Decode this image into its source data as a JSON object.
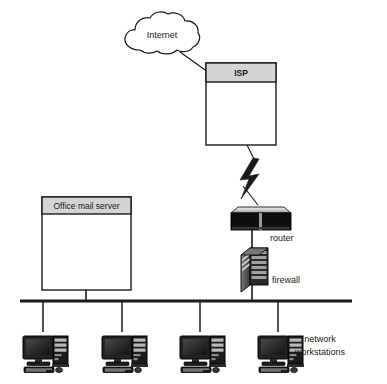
{
  "diagram": {
    "type": "network-topology",
    "background_color": "#ffffff",
    "line_color": "#1a1a1a",
    "header_fill": "#d4d4d4",
    "body_fill": "#ffffff",
    "device_dark": "#151515",
    "device_mid": "#5a5a5a",
    "device_light": "#cfcfcf"
  },
  "cloud": {
    "label": "Internet",
    "icon": "cloud-icon"
  },
  "isp": {
    "header_label": "ISP",
    "icon": "server-box-icon"
  },
  "mail_server": {
    "header_label": "Office mail server",
    "icon": "server-box-icon"
  },
  "router": {
    "label": "router",
    "icon": "router-icon"
  },
  "firewall": {
    "label": "firewall",
    "icon": "firewall-icon"
  },
  "bus": {
    "label": "network-backbone"
  },
  "workstations": {
    "group_label_line1": "network",
    "group_label_line2": "workstations",
    "items": [
      {
        "icon": "workstation-icon"
      },
      {
        "icon": "workstation-icon"
      },
      {
        "icon": "workstation-icon"
      },
      {
        "icon": "workstation-icon"
      }
    ]
  },
  "connections": [
    {
      "from": "cloud",
      "to": "isp",
      "style": "solid"
    },
    {
      "from": "isp",
      "to": "lightning",
      "style": "solid"
    },
    {
      "from": "lightning",
      "to": "router",
      "style": "bolt"
    },
    {
      "from": "router",
      "to": "firewall",
      "style": "solid"
    },
    {
      "from": "firewall",
      "to": "bus",
      "style": "solid"
    },
    {
      "from": "mail_server",
      "to": "bus",
      "style": "solid"
    },
    {
      "from": "bus",
      "to": "workstation-1",
      "style": "solid"
    },
    {
      "from": "bus",
      "to": "workstation-2",
      "style": "solid"
    },
    {
      "from": "bus",
      "to": "workstation-3",
      "style": "solid"
    },
    {
      "from": "bus",
      "to": "workstation-4",
      "style": "solid"
    }
  ]
}
